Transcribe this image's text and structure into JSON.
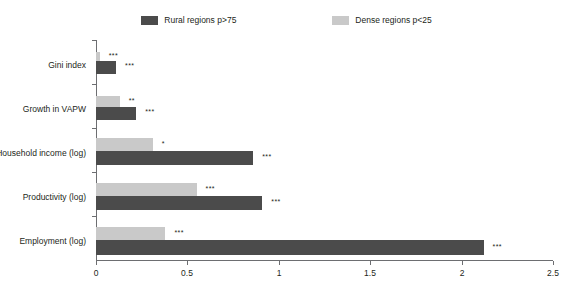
{
  "legend": {
    "entries": [
      {
        "label": "Rural regions p>75",
        "color": "#4b4b4b",
        "key": "rural"
      },
      {
        "label": "Dense regions p<25",
        "color": "#c9c9c9",
        "key": "dense"
      }
    ]
  },
  "axis": {
    "x_ticks": [
      "0",
      "0.5",
      "1",
      "1.5",
      "2",
      "2.5"
    ],
    "x_tick_values": [
      0,
      0.5,
      1,
      1.5,
      2,
      2.5
    ]
  },
  "categories": [
    {
      "label": "Gini index"
    },
    {
      "label": "Growth in VAPW"
    },
    {
      "label": "Household income (log)"
    },
    {
      "label": "Productivity (log)"
    },
    {
      "label": "Employment (log)"
    }
  ],
  "bars": {
    "gini": {
      "dense_value": 0.02,
      "dense_sig": "***",
      "rural_value": 0.11,
      "rural_sig": "***"
    },
    "growth": {
      "dense_value": 0.13,
      "dense_sig": "**",
      "rural_value": 0.22,
      "rural_sig": "***"
    },
    "household": {
      "dense_value": 0.31,
      "dense_sig": "*",
      "rural_value": 0.86,
      "rural_sig": "***"
    },
    "productivity": {
      "dense_value": 0.55,
      "dense_sig": "***",
      "rural_value": 0.91,
      "rural_sig": "***"
    },
    "employment": {
      "dense_value": 0.38,
      "dense_sig": "***",
      "rural_value": 2.12,
      "rural_sig": "***"
    }
  },
  "chart_data": {
    "type": "bar",
    "orientation": "horizontal",
    "title": "",
    "xlabel": "",
    "ylabel": "",
    "xlim": [
      0,
      2.5
    ],
    "grid": false,
    "legend_position": "top-center",
    "categories": [
      "Gini index",
      "Growth in VAPW",
      "Household income (log)",
      "Productivity (log)",
      "Employment (log)"
    ],
    "series": [
      {
        "name": "Rural regions p>75",
        "color": "#4b4b4b",
        "values": [
          0.11,
          0.22,
          0.86,
          0.91,
          2.12
        ],
        "annotations": [
          "***",
          "***",
          "***",
          "***",
          "***"
        ]
      },
      {
        "name": "Dense regions p<25",
        "color": "#c9c9c9",
        "values": [
          0.02,
          0.13,
          0.31,
          0.55,
          0.38
        ],
        "annotations": [
          "***",
          "**",
          "*",
          "***",
          "***"
        ]
      }
    ],
    "xticks": [
      0,
      0.5,
      1,
      1.5,
      2,
      2.5
    ],
    "xticklabels": [
      "0",
      "0.5",
      "1",
      "1.5",
      "2",
      "2.5"
    ]
  }
}
